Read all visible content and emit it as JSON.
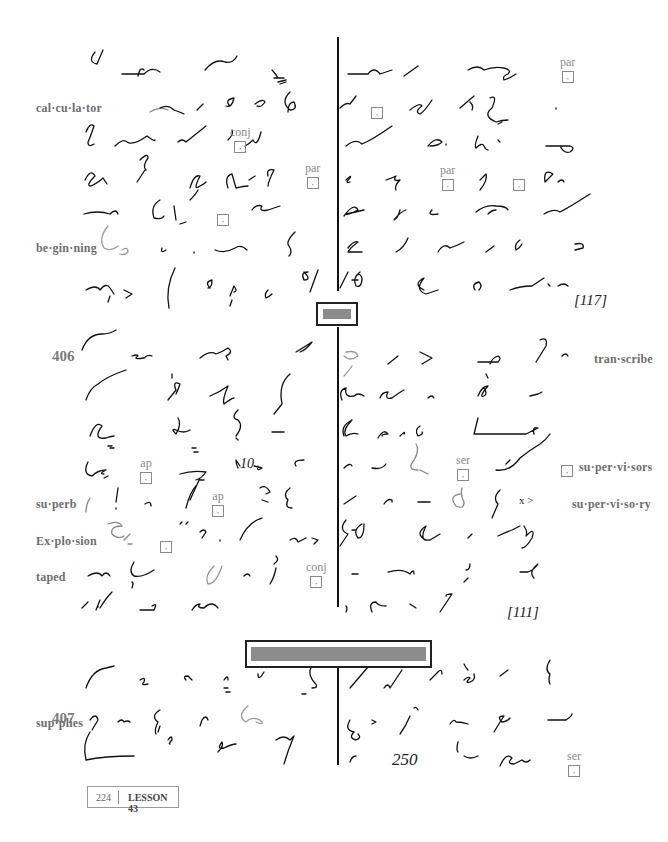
{
  "page": {
    "number": "224",
    "lesson": "LESSON 43"
  },
  "sections": [
    {
      "id": "405-cont",
      "word_count": "[117]",
      "glosses": [
        "cal·cu·la·tor",
        "be·gin·ning"
      ],
      "marks": [
        {
          "label": "conj",
          "symbol": ","
        },
        {
          "label": "par",
          "symbol": ","
        },
        {
          "label": "",
          "symbol": ","
        },
        {
          "label": "par",
          "symbol": ","
        },
        {
          "label": "",
          "symbol": ","
        },
        {
          "label": "par",
          "symbol": ","
        },
        {
          "label": "",
          "symbol": ","
        }
      ]
    },
    {
      "id": "406",
      "number": "406",
      "word_count": "[111]",
      "glosses": [
        "tran·scribe",
        "su·per·vi·sors",
        "su·perb",
        "su·per·vi·so·ry",
        "Ex·plo·sion",
        "taped"
      ],
      "marks": [
        {
          "label": "ap",
          "symbol": ","
        },
        {
          "label": "ap",
          "symbol": ","
        },
        {
          "label": "",
          "symbol": ","
        },
        {
          "label": "conj",
          "symbol": ","
        },
        {
          "label": "ser",
          "symbol": ","
        },
        {
          "label": "",
          "symbol": ","
        }
      ],
      "inline_text": [
        "10",
        "x >"
      ]
    },
    {
      "id": "407",
      "number": "407",
      "glosses": [
        "sup·plies"
      ],
      "marks": [
        {
          "label": "ser",
          "symbol": ","
        }
      ],
      "inline_text": [
        "250"
      ]
    }
  ],
  "colors": {
    "ink": "#111111",
    "gloss": "#7a7a7a",
    "separator_fill": "#8c8c8c"
  }
}
